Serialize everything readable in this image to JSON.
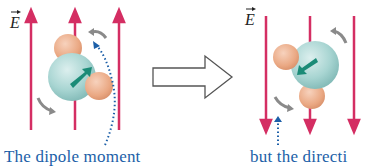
{
  "left_panel": {
    "field_label": "E",
    "field_direction": "up",
    "caption": "The dipole moment"
  },
  "right_panel": {
    "field_label": "E",
    "field_direction": "down",
    "caption": "but the directi"
  },
  "colors": {
    "field_lines": "#d42e63",
    "oxygen": "#a8d5d2",
    "hydrogen": "#eaa883",
    "dipole_arrow": "#1b8b77",
    "rotation_arrow": "#8a8a8a",
    "pointer": "#1c5fa8",
    "caption_text": "#1c5fa8"
  }
}
